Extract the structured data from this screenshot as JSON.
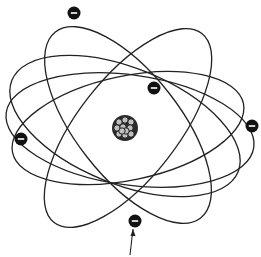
{
  "diagram": {
    "type": "atom-model",
    "nucleus": {
      "cx": 125,
      "cy": 128,
      "r": 13,
      "fill": "#2a2a2a",
      "highlight": "#bfbfbf"
    },
    "orbits": [
      {
        "cx": 128,
        "cy": 125,
        "rx": 52,
        "ry": 118,
        "rotate": -38
      },
      {
        "cx": 128,
        "cy": 128,
        "rx": 50,
        "ry": 120,
        "rotate": 38
      },
      {
        "cx": 130,
        "cy": 130,
        "rx": 125,
        "ry": 55,
        "rotate": 8
      },
      {
        "cx": 128,
        "cy": 128,
        "rx": 118,
        "ry": 52,
        "rotate": -12
      },
      {
        "cx": 125,
        "cy": 126,
        "rx": 122,
        "ry": 58,
        "rotate": 22
      }
    ],
    "electrons": [
      {
        "cx": 74,
        "cy": 13,
        "sign": "−"
      },
      {
        "cx": 154,
        "cy": 88,
        "sign": "−"
      },
      {
        "cx": 21,
        "cy": 139,
        "sign": "−"
      },
      {
        "cx": 252,
        "cy": 126,
        "sign": "−"
      },
      {
        "cx": 135,
        "cy": 221,
        "sign": "−"
      }
    ],
    "arrow": {
      "x1": 130,
      "y1": 255,
      "x2": 133,
      "y2": 229
    },
    "colors": {
      "line": "#222222",
      "electron": "#111111",
      "background": "#ffffff"
    }
  }
}
